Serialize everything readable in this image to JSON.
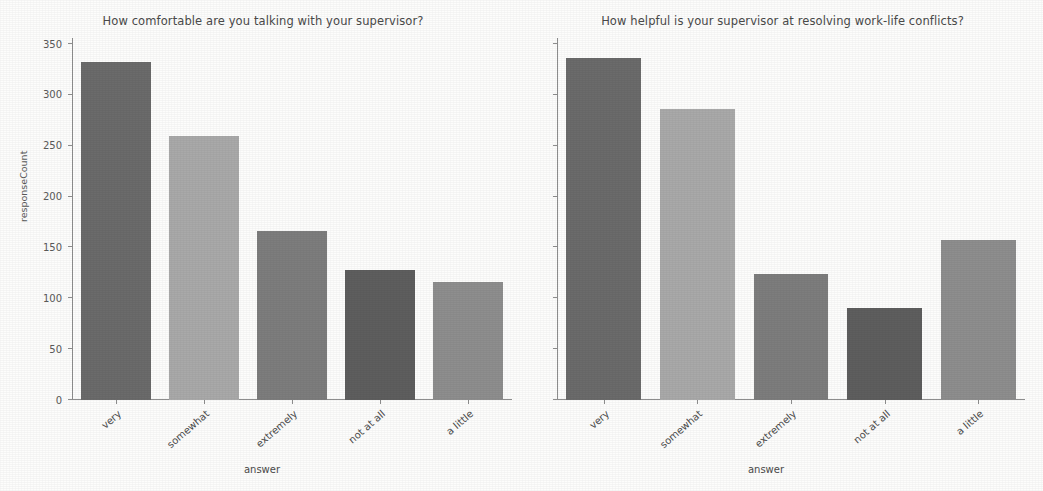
{
  "figure": {
    "background_color": "#fdfdfc",
    "axis_color": "#8e8e8e",
    "text_color": "#4a4a4a"
  },
  "chart_data": [
    {
      "type": "bar",
      "panel": "left",
      "title": "How comfortable are you talking with your supervisor?",
      "xlabel": "answer",
      "ylabel": "responseCount",
      "categories": [
        "very",
        "somewhat",
        "extremely",
        "not at all",
        "a little"
      ],
      "values": [
        332,
        260,
        166,
        128,
        116
      ],
      "ylim": [
        0,
        350
      ],
      "yticks": [
        0,
        50,
        100,
        150,
        200,
        250,
        300,
        350
      ],
      "ytick_labels": [
        "0",
        "50",
        "100",
        "150",
        "200",
        "250",
        "300",
        "350"
      ],
      "grid": false,
      "legend": "none",
      "bar_colors": [
        "#6b6b6b",
        "#a9a9a9",
        "#7d7d7d",
        "#5e5e5e",
        "#8e8e8e"
      ]
    },
    {
      "type": "bar",
      "panel": "right",
      "title": "How helpful is your supervisor at resolving work-life conflicts?",
      "xlabel": "answer",
      "ylabel": "",
      "categories": [
        "very",
        "somewhat",
        "extremely",
        "not at all",
        "a little"
      ],
      "values": [
        336,
        286,
        124,
        90,
        157
      ],
      "ylim": [
        0,
        350
      ],
      "yticks": [
        0,
        50,
        100,
        150,
        200,
        250,
        300,
        350
      ],
      "ytick_labels": [
        "",
        "",
        "",
        "",
        "",
        "",
        "",
        ""
      ],
      "grid": false,
      "legend": "none",
      "bar_colors": [
        "#6b6b6b",
        "#a9a9a9",
        "#7d7d7d",
        "#5e5e5e",
        "#8e8e8e"
      ]
    }
  ]
}
